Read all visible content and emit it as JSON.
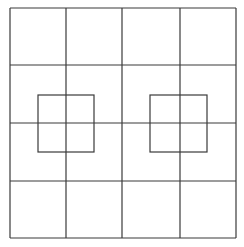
{
  "diagram": {
    "type": "grid-with-inner-squares",
    "background": "#ffffff",
    "stroke_color": "#3a3a3a",
    "stroke_width": 1.2,
    "grid": {
      "rows": 4,
      "cols": 4,
      "x_lines": [
        10,
        66,
        122,
        180,
        236
      ],
      "y_lines": [
        8,
        65,
        123,
        181,
        238
      ]
    },
    "inner_squares": [
      {
        "name": "left-inner-square",
        "x": 38,
        "y": 95,
        "width": 56,
        "height": 57
      },
      {
        "name": "right-inner-square",
        "x": 150,
        "y": 95,
        "width": 57,
        "height": 57
      }
    ]
  }
}
